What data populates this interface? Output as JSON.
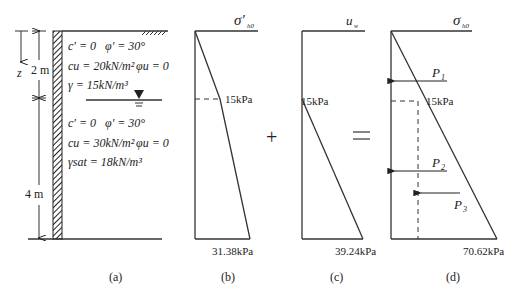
{
  "figure": {
    "panel_a": {
      "caption": "(a)",
      "depth_label": "z",
      "dim_top": "2 m",
      "dim_bottom": "4 m",
      "layer1": {
        "line1_c": "c′ = 0",
        "line1_phi": "φ′ = 30°",
        "line2_cu": "cu = 20kN/m²",
        "line2_phiu": "φu = 0",
        "line3_gamma": "γ = 15kN/m³"
      },
      "layer2": {
        "line1_c": "c′ = 0",
        "line1_phi": "φ′ = 30°",
        "line2_cu": "cu = 30kN/m²",
        "line2_phiu": "φu = 0",
        "line3_gamma": "γsat = 18kN/m³"
      }
    },
    "panel_b": {
      "caption": "(b)",
      "title_sym": "σ′",
      "title_sub": "h0",
      "mid_value": "15kPa",
      "bottom_value": "31.38kPa"
    },
    "operator_plus": "+",
    "panel_c": {
      "caption": "(c)",
      "title_sym": "u",
      "title_sub": "w",
      "mid_value": "15kPa",
      "bottom_value": "39.24kPa"
    },
    "operator_equals": "=",
    "panel_d": {
      "caption": "(d)",
      "title_sym": "σ",
      "title_sub": "h0",
      "mid_value": "15kPa",
      "bottom_value": "70.62kPa",
      "forces": [
        {
          "sym": "P",
          "sub": "1"
        },
        {
          "sym": "P",
          "sub": "2"
        },
        {
          "sym": "P",
          "sub": "3"
        }
      ]
    }
  }
}
